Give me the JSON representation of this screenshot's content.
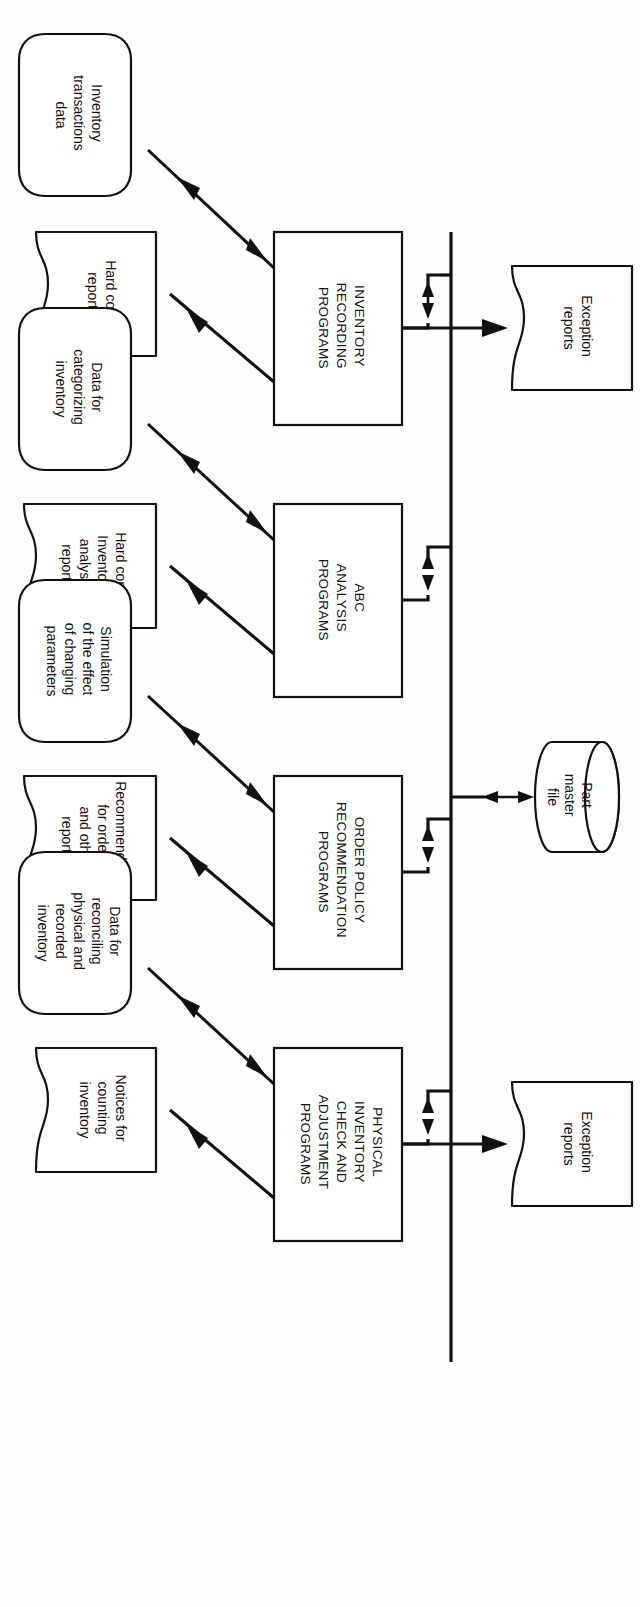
{
  "diagram": {
    "orientation": "rotated-90-clockwise",
    "ink_color": "#111111",
    "paper_color": "#fdfdfc"
  },
  "datastore": {
    "name": "part-master-file",
    "shape": "cylinder",
    "lines": [
      "Part",
      "master",
      "file"
    ]
  },
  "bus": {
    "name": "shared-data-bus",
    "connector": "double-headed-arrow"
  },
  "processes": [
    {
      "id": "inventory-recording-programs",
      "lines": [
        "INVENTORY",
        "RECORDING",
        "PROGRAMS"
      ]
    },
    {
      "id": "abc-analysis-programs",
      "lines": [
        "ABC",
        "ANALYSIS",
        "PROGRAMS"
      ]
    },
    {
      "id": "order-policy-recommendation-programs",
      "lines": [
        "ORDER POLICY",
        "RECOMMENDATION",
        "PROGRAMS"
      ]
    },
    {
      "id": "physical-inventory-check-and-adjustment-programs",
      "lines": [
        "PHYSICAL",
        "INVENTORY",
        "CHECK AND",
        "ADJUSTMENT",
        "PROGRAMS"
      ]
    }
  ],
  "nodes": [
    {
      "id": "exception-reports-recording",
      "shape": "document",
      "lines": [
        "Exception",
        "reports"
      ],
      "from": "inventory-recording-programs"
    },
    {
      "id": "inventory-transactions-data",
      "shape": "data",
      "lines": [
        "Inventory",
        "transactions",
        "data"
      ],
      "from": "inventory-recording-programs",
      "direction": "bidirectional"
    },
    {
      "id": "hard-copy-reports",
      "shape": "document",
      "lines": [
        "Hard copy",
        "reports"
      ],
      "from": "inventory-recording-programs",
      "direction": "out"
    },
    {
      "id": "data-for-categorizing-inventory",
      "shape": "data",
      "lines": [
        "Data for",
        "categorizing",
        "inventory"
      ],
      "from": "abc-analysis-programs",
      "direction": "bidirectional"
    },
    {
      "id": "hard-copy-inventory-analysis-reports",
      "shape": "document",
      "lines": [
        "Hard copy",
        "Inventory",
        "analysis",
        "reports"
      ],
      "from": "abc-analysis-programs",
      "direction": "out"
    },
    {
      "id": "simulation-of-the-effect-of-changing-parameters",
      "shape": "data",
      "lines": [
        "Simulation",
        "of the effect",
        "of changing",
        "parameters"
      ],
      "from": "order-policy-recommendation-programs",
      "direction": "bidirectional"
    },
    {
      "id": "recommendation-for-orders-and-other-reports",
      "shape": "document",
      "lines": [
        "Recommendation",
        "for orders,",
        "and other",
        "reports"
      ],
      "from": "order-policy-recommendation-programs",
      "direction": "out"
    },
    {
      "id": "data-for-reconciling-physical-and-recorded-inventory",
      "shape": "data",
      "lines": [
        "Data for",
        "reconciling",
        "physical and",
        "recorded",
        "inventory"
      ],
      "from": "physical-inventory-check-and-adjustment-programs",
      "direction": "bidirectional"
    },
    {
      "id": "notices-for-counting-inventory",
      "shape": "document",
      "lines": [
        "Notices for",
        "counting",
        "inventory"
      ],
      "from": "physical-inventory-check-and-adjustment-programs",
      "direction": "out"
    },
    {
      "id": "exception-reports-physical",
      "shape": "document",
      "lines": [
        "Exception",
        "reports"
      ],
      "from": "physical-inventory-check-and-adjustment-programs",
      "direction": "out"
    }
  ]
}
